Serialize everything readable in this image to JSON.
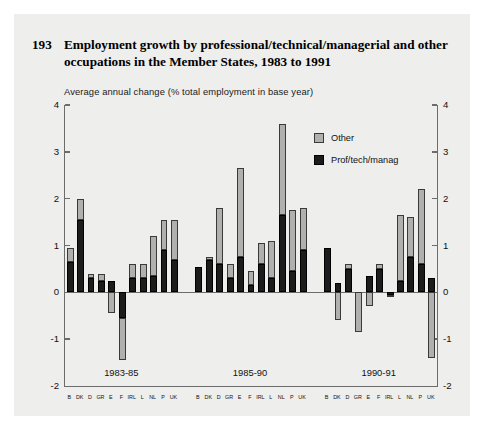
{
  "figure": {
    "number": "193",
    "title": "Employment growth by professional/technical/managerial and other occupations in the Member States, 1983 to 1991",
    "subtitle": "Average annual change (% total employment in base year)"
  },
  "legend": {
    "position": "top-right",
    "items": [
      {
        "label": "Other",
        "color": "#b0b0ae",
        "key": "other"
      },
      {
        "label": "Prof/tech/manag",
        "color": "#1c1c1c",
        "key": "prof"
      }
    ]
  },
  "axis": {
    "y_ticks": [
      "4",
      "3",
      "2",
      "1",
      "0",
      "-1",
      "-2"
    ],
    "y_ticks_right": [
      "4",
      "3",
      "2",
      "1",
      "0",
      "-1",
      "-2"
    ]
  },
  "chart_data": {
    "type": "bar",
    "title": "Employment growth by professional/technical/managerial and other occupations in the Member States, 1983 to 1991",
    "subtitle": "Average annual change (% total employment in base year)",
    "stacked": true,
    "xlabel": "",
    "ylabel": "Average annual change (% total employment in base year)",
    "ylim": [
      -2,
      4
    ],
    "ytick_step": 1,
    "grid": false,
    "legend_position": "top-right",
    "categories": [
      "B",
      "DK",
      "D",
      "GR",
      "E",
      "F",
      "IRL",
      "L",
      "NL",
      "P",
      "UK"
    ],
    "groups": [
      {
        "label": "1983-85",
        "series": [
          {
            "name": "Prof/tech/manag",
            "color": "#1c1c1c",
            "values": [
              0.65,
              1.55,
              0.3,
              0.25,
              0.25,
              -0.55,
              0.3,
              0.3,
              0.35,
              0.9,
              0.7
            ]
          },
          {
            "name": "Other",
            "color": "#b0b0ae",
            "values": [
              0.3,
              0.45,
              0.1,
              0.15,
              -0.45,
              -0.9,
              0.3,
              0.3,
              0.85,
              0.65,
              0.85
            ]
          }
        ],
        "totals": [
          0.95,
          2.0,
          0.4,
          0.4,
          -0.2,
          -1.45,
          0.6,
          0.6,
          1.2,
          1.55,
          1.55
        ]
      },
      {
        "label": "1985-90",
        "series": [
          {
            "name": "Prof/tech/manag",
            "color": "#1c1c1c",
            "values": [
              0.55,
              0.7,
              0.6,
              0.3,
              0.75,
              0.15,
              0.6,
              0.3,
              1.65,
              0.45,
              0.9
            ]
          },
          {
            "name": "Other",
            "color": "#b0b0ae",
            "values": [
              0.0,
              0.05,
              1.2,
              0.3,
              1.9,
              0.3,
              0.45,
              0.8,
              1.95,
              1.3,
              0.9
            ]
          }
        ],
        "totals": [
          0.55,
          0.75,
          1.8,
          0.6,
          2.65,
          0.45,
          1.05,
          1.1,
          3.6,
          1.75,
          1.8
        ]
      },
      {
        "label": "1990-91",
        "series": [
          {
            "name": "Prof/tech/manag",
            "color": "#1c1c1c",
            "values": [
              0.95,
              0.2,
              0.5,
              0.0,
              0.35,
              0.5,
              -0.05,
              0.25,
              0.75,
              0.6,
              0.3
            ]
          },
          {
            "name": "Other",
            "color": "#b0b0ae",
            "values": [
              0.0,
              -0.6,
              0.1,
              -0.85,
              -0.3,
              0.1,
              -0.05,
              1.4,
              0.85,
              1.6,
              -1.4
            ]
          }
        ],
        "totals": [
          0.95,
          -0.4,
          0.6,
          -0.85,
          0.05,
          0.6,
          -0.1,
          1.65,
          1.6,
          2.2,
          -1.1
        ]
      }
    ]
  }
}
